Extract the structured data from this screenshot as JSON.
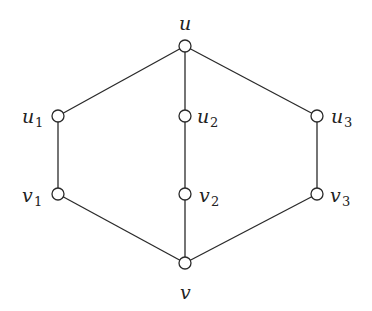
{
  "diagram": {
    "type": "graph",
    "nodes": [
      {
        "id": "u",
        "name": "u",
        "sub": "",
        "x": 185,
        "y": 46,
        "label_pos": "above"
      },
      {
        "id": "u1",
        "name": "u",
        "sub": "1",
        "x": 58,
        "y": 116,
        "label_pos": "left"
      },
      {
        "id": "u2",
        "name": "u",
        "sub": "2",
        "x": 185,
        "y": 116,
        "label_pos": "right"
      },
      {
        "id": "u3",
        "name": "u",
        "sub": "3",
        "x": 317,
        "y": 116,
        "label_pos": "right"
      },
      {
        "id": "v1",
        "name": "v",
        "sub": "1",
        "x": 58,
        "y": 194,
        "label_pos": "left"
      },
      {
        "id": "v2",
        "name": "v",
        "sub": "2",
        "x": 185,
        "y": 194,
        "label_pos": "right"
      },
      {
        "id": "v3",
        "name": "v",
        "sub": "3",
        "x": 317,
        "y": 194,
        "label_pos": "right"
      },
      {
        "id": "v",
        "name": "v",
        "sub": "",
        "x": 185,
        "y": 263,
        "label_pos": "below"
      }
    ],
    "edges": [
      [
        "u",
        "u1"
      ],
      [
        "u",
        "u2"
      ],
      [
        "u",
        "u3"
      ],
      [
        "u1",
        "v1"
      ],
      [
        "u2",
        "v2"
      ],
      [
        "u3",
        "v3"
      ],
      [
        "v1",
        "v"
      ],
      [
        "v2",
        "v"
      ],
      [
        "v3",
        "v"
      ]
    ],
    "node_radius": 6,
    "colors": {
      "stroke": "#2a2a2a",
      "fill": "#ffffff",
      "background": "#ffffff"
    }
  },
  "labels": {
    "u": "u",
    "u1": "u",
    "u1_sub": "1",
    "u2": "u",
    "u2_sub": "2",
    "u3": "u",
    "u3_sub": "3",
    "v1": "v",
    "v1_sub": "1",
    "v2": "v",
    "v2_sub": "2",
    "v3": "v",
    "v3_sub": "3",
    "v": "v"
  }
}
